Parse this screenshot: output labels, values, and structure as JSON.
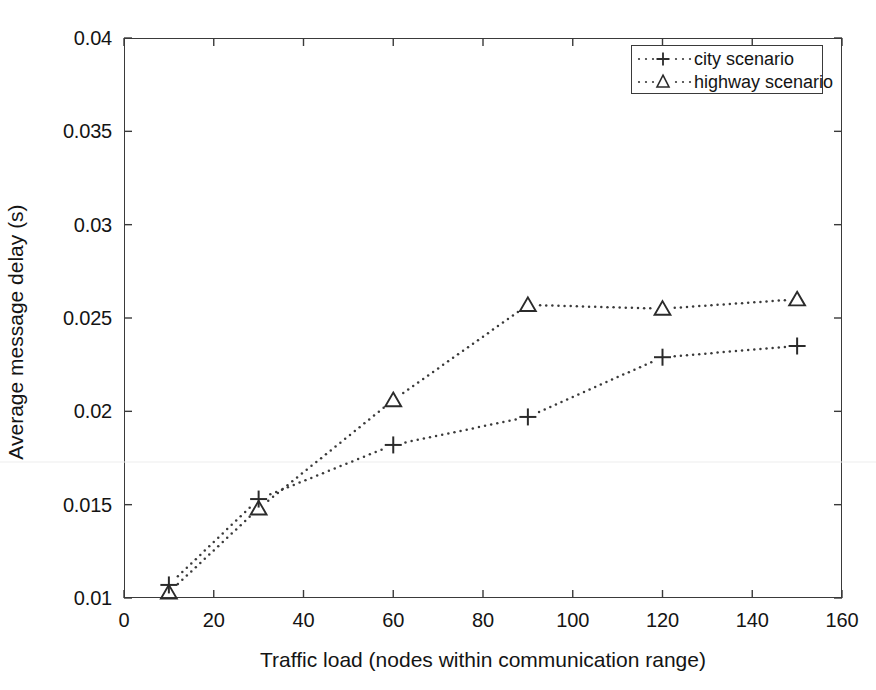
{
  "chart_data": {
    "type": "line",
    "title": "",
    "xlabel": "Traffic load (nodes within communication range)",
    "ylabel": "Average message delay (s)",
    "xlim": [
      0,
      160
    ],
    "ylim": [
      0.01,
      0.04
    ],
    "xticks": [
      "0",
      "20",
      "40",
      "60",
      "80",
      "100",
      "120",
      "140",
      "160"
    ],
    "xtick_values": [
      0,
      20,
      40,
      60,
      80,
      100,
      120,
      140,
      160
    ],
    "yticks": [
      "0.01",
      "0.015",
      "0.02",
      "0.025",
      "0.03",
      "0.035",
      "0.04"
    ],
    "ytick_values": [
      0.01,
      0.015,
      0.02,
      0.025,
      0.03,
      0.035,
      0.04
    ],
    "grid": false,
    "legend_position": "upper right",
    "linestyle": "dotted",
    "line_color": "#3a3a3a",
    "marker_color": "#2b2b2b",
    "x": [
      10,
      30,
      60,
      90,
      120,
      150
    ],
    "series": [
      {
        "name": "city scenario",
        "marker": "plus",
        "values": [
          0.0107,
          0.0153,
          0.0182,
          0.0197,
          0.0229,
          0.0235
        ]
      },
      {
        "name": "highway scenario",
        "marker": "triangle-up",
        "values": [
          0.0103,
          0.0148,
          0.0206,
          0.0257,
          0.0255,
          0.026
        ]
      }
    ]
  },
  "legend": {
    "entries": [
      {
        "label": "city scenario",
        "marker": "plus-marker-icon"
      },
      {
        "label": "highway scenario",
        "marker": "triangle-marker-icon"
      }
    ]
  },
  "axes": {
    "x_title": "Traffic load (nodes within communication range)",
    "y_title": "Average message delay (s)"
  }
}
